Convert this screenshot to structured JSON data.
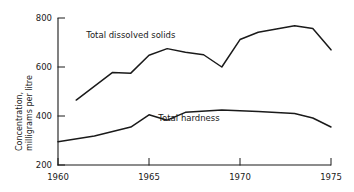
{
  "chart_data": {
    "type": "line",
    "title": "",
    "xlabel": "",
    "ylabel": "Concentration, milligrams per litre",
    "ylabel_line1": "Concentration,",
    "ylabel_line2": "milligrams per litre",
    "xlim": [
      1960,
      1975
    ],
    "ylim": [
      200,
      800
    ],
    "xticks": [
      1960,
      1965,
      1970,
      1975
    ],
    "xticklabels": [
      "1960",
      "1965",
      "1970",
      "1975"
    ],
    "yticks": [
      200,
      400,
      600,
      800
    ],
    "yticklabels": [
      "200",
      "400",
      "600",
      "800"
    ],
    "grid": false,
    "legend": "inline-annotations",
    "line_color": "#1a1a1a",
    "series": [
      {
        "name": "Total dissolved solids",
        "label_x": 1964.0,
        "label_y": 718,
        "x": [
          1961,
          1963,
          1964,
          1965,
          1966,
          1967,
          1968,
          1969,
          1970,
          1971,
          1972,
          1973,
          1974,
          1975
        ],
        "values": [
          465,
          578,
          575,
          648,
          675,
          660,
          650,
          600,
          712,
          742,
          755,
          768,
          757,
          670
        ]
      },
      {
        "name": "Total hardness",
        "label_x": 1967.2,
        "label_y": 378,
        "x": [
          1960,
          1962,
          1964,
          1965,
          1966,
          1967,
          1969,
          1971,
          1973,
          1974,
          1975
        ],
        "values": [
          295,
          318,
          355,
          405,
          383,
          415,
          425,
          418,
          410,
          392,
          355
        ]
      }
    ]
  }
}
